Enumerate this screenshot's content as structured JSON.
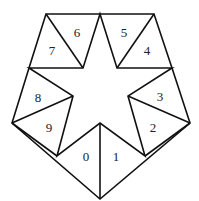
{
  "diagram": {
    "stroke_color": "#111111",
    "background": "#ffffff",
    "vertices": {
      "top_left": [
        46,
        14
      ],
      "top_mid": [
        100,
        14
      ],
      "top_right": [
        154,
        14
      ],
      "inner_top_left": [
        83,
        68
      ],
      "inner_top_right": [
        117,
        68
      ],
      "upper_left": [
        29,
        68
      ],
      "upper_right": [
        172,
        68
      ],
      "inner_left": [
        73,
        96
      ],
      "inner_right": [
        128,
        96
      ],
      "left": [
        12,
        123
      ],
      "right": [
        190,
        123
      ],
      "low_left": [
        57,
        156
      ],
      "low_right": [
        145,
        156
      ],
      "inner_bottom": [
        100,
        123
      ],
      "bottom": [
        100,
        199
      ]
    },
    "triangles": [
      {
        "label": "0",
        "x": 86,
        "y": 156
      },
      {
        "label": "1",
        "x": 116,
        "y": 156
      },
      {
        "label": "2",
        "x": 153,
        "y": 127
      },
      {
        "label": "3",
        "x": 160,
        "y": 96
      },
      {
        "label": "4",
        "x": 147,
        "y": 50
      },
      {
        "label": "5",
        "x": 124,
        "y": 32
      },
      {
        "label": "6",
        "x": 77,
        "y": 32
      },
      {
        "label": "7",
        "x": 52,
        "y": 50
      },
      {
        "label": "8",
        "x": 38,
        "y": 97
      },
      {
        "label": "9",
        "x": 49,
        "y": 127
      }
    ]
  }
}
